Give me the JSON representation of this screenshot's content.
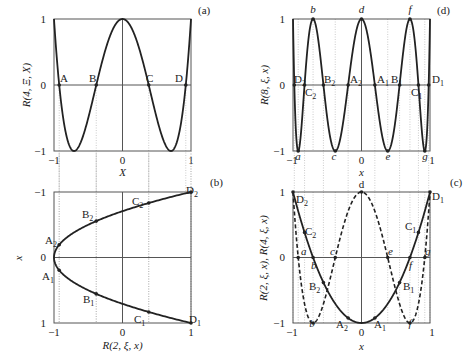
{
  "chart_data": [
    {
      "panel": "(a)",
      "type": "line",
      "title": "",
      "xlabel": "X",
      "ylabel": "R(4, Ξ, X)",
      "xlim": [
        -1,
        1
      ],
      "ylim": [
        -1,
        1
      ],
      "xticks": [
        "-1",
        "0",
        "1"
      ],
      "yticks": [
        "-1",
        "0",
        "1"
      ],
      "series": [
        {
          "name": "R(4, Ξ, X)",
          "style": "solid",
          "function": "8X^4 - 8X^2 + 1",
          "x": [
            -1,
            -0.924,
            -0.707,
            -0.383,
            0,
            0.383,
            0.707,
            0.924,
            1
          ],
          "y": [
            1,
            0,
            -1,
            0,
            1,
            0,
            -1,
            0,
            1
          ]
        }
      ],
      "points": [
        {
          "label": "A",
          "x": -0.924,
          "y": 0
        },
        {
          "label": "B",
          "x": -0.383,
          "y": 0
        },
        {
          "label": "C",
          "x": 0.383,
          "y": 0
        },
        {
          "label": "D",
          "x": 0.924,
          "y": 0
        }
      ]
    },
    {
      "panel": "(b)",
      "type": "line",
      "xlabel": "R(2, ξ, x)",
      "ylabel": "x",
      "xlim": [
        -1,
        1
      ],
      "ylim": [
        1,
        -1
      ],
      "xticks": [
        "-1",
        "0",
        "1"
      ],
      "yticks": [
        "-1",
        "0",
        "1"
      ],
      "series": [
        {
          "name": "R(2, ξ, x) = 2x^2 - 1",
          "style": "solid",
          "x": [
            1,
            0.383,
            -0.383,
            -0.924,
            -1,
            -0.924,
            -0.383,
            0.383,
            1
          ],
          "y": [
            -1,
            -0.831,
            -0.556,
            -0.195,
            0,
            0.195,
            0.556,
            0.831,
            1
          ]
        }
      ],
      "points": [
        {
          "label": "A2",
          "x": -0.924,
          "y": -0.195
        },
        {
          "label": "B2",
          "x": -0.383,
          "y": -0.556
        },
        {
          "label": "C2",
          "x": 0.383,
          "y": -0.831
        },
        {
          "label": "D2",
          "x": 1,
          "y": -1
        },
        {
          "label": "A1",
          "x": -0.924,
          "y": 0.195
        },
        {
          "label": "B1",
          "x": -0.383,
          "y": 0.556
        },
        {
          "label": "C1",
          "x": 0.383,
          "y": 0.831
        },
        {
          "label": "D1",
          "x": 1,
          "y": 1
        }
      ]
    },
    {
      "panel": "(d)",
      "type": "line",
      "xlabel": "x",
      "ylabel": "R(8, ξ, x)",
      "xlim": [
        -1,
        1
      ],
      "ylim": [
        -1,
        1
      ],
      "xticks": [
        "-1",
        "0",
        "1"
      ],
      "yticks": [
        "-1",
        "0",
        "1"
      ],
      "series": [
        {
          "name": "R(8, ξ, x)",
          "style": "solid",
          "function": "T8(x)"
        }
      ],
      "points": [
        {
          "label": "D2",
          "x": -0.981,
          "y": 0
        },
        {
          "label": "C2",
          "x": -0.831,
          "y": 0
        },
        {
          "label": "B2",
          "x": -0.556,
          "y": 0
        },
        {
          "label": "A2",
          "x": -0.195,
          "y": 0
        },
        {
          "label": "A1",
          "x": 0.195,
          "y": 0
        },
        {
          "label": "B1",
          "x": 0.556,
          "y": 0
        },
        {
          "label": "C1",
          "x": 0.831,
          "y": 0
        },
        {
          "label": "D1",
          "x": 0.981,
          "y": 0
        },
        {
          "label": "a",
          "x": -0.924,
          "y": -1
        },
        {
          "label": "b",
          "x": -0.707,
          "y": 1
        },
        {
          "label": "c",
          "x": -0.383,
          "y": -1
        },
        {
          "label": "d",
          "x": 0,
          "y": 1
        },
        {
          "label": "e",
          "x": 0.383,
          "y": -1
        },
        {
          "label": "f",
          "x": 0.707,
          "y": 1
        },
        {
          "label": "g",
          "x": 0.924,
          "y": -1
        }
      ]
    },
    {
      "panel": "(c)",
      "type": "line",
      "xlabel": "x",
      "ylabel": "R(2, ξ, x), R(4, ξ, x)",
      "xlim": [
        -1,
        1
      ],
      "ylim": [
        -1,
        1
      ],
      "xticks": [
        "-1",
        "0",
        "1"
      ],
      "yticks": [
        "-1",
        "0",
        "1"
      ],
      "series": [
        {
          "name": "R(2, ξ, x)",
          "style": "solid",
          "function": "2x^2 - 1"
        },
        {
          "name": "R(4, ξ, x)",
          "style": "dashed",
          "function": "8x^4 - 8x^2 + 1"
        }
      ],
      "points": [
        {
          "label": "D2",
          "x": -1,
          "y": 1
        },
        {
          "label": "C2",
          "x": -0.831,
          "y": 0.383
        },
        {
          "label": "B2",
          "x": -0.556,
          "y": -0.383
        },
        {
          "label": "A2",
          "x": -0.195,
          "y": -0.924
        },
        {
          "label": "A1",
          "x": 0.195,
          "y": -0.924
        },
        {
          "label": "B1",
          "x": 0.556,
          "y": -0.383
        },
        {
          "label": "C1",
          "x": 0.831,
          "y": 0.383
        },
        {
          "label": "D1",
          "x": 1,
          "y": 1
        },
        {
          "label": "a",
          "x": -0.924,
          "y": 0
        },
        {
          "label": "b",
          "x": -0.707,
          "y": 0
        },
        {
          "label": "c",
          "x": -0.383,
          "y": 0
        },
        {
          "label": "d",
          "x": 0,
          "y": 1
        },
        {
          "label": "e",
          "x": 0.383,
          "y": 0
        },
        {
          "label": "f",
          "x": 0.707,
          "y": 0
        },
        {
          "label": "g",
          "x": 0.924,
          "y": 0
        }
      ]
    }
  ],
  "panels": {
    "a": {
      "tag": "(a)",
      "ylabel": "R(4, Ξ, X)",
      "xlabel": "X",
      "yt_top": "1",
      "yt_mid": "0",
      "yt_bot": "−1",
      "xt_left": "−1",
      "xt_mid": "0",
      "xt_right": "1",
      "pts": [
        "A",
        "B",
        "C",
        "D"
      ]
    },
    "b": {
      "tag": "(b)",
      "ylabel": "x",
      "xlabel": "R(2, ξ, x)",
      "yt_top": "−1",
      "yt_mid": "0",
      "yt_bot": "1",
      "xt_left": "−1",
      "xt_mid": "0",
      "xt_right": "1"
    },
    "d": {
      "tag": "(d)",
      "ylabel": "R(8, ξ, x)",
      "xlabel": "x",
      "yt_top": "1",
      "yt_mid": "0",
      "yt_bot": "−1",
      "xt_left": "−1",
      "xt_mid": "0",
      "xt_right": "1"
    },
    "c": {
      "tag": "(c)",
      "ylabel": "R(2, ξ, x), R(4, ξ, x)",
      "xlabel": "x",
      "yt_top": "1",
      "yt_mid": "0",
      "yt_bot": "−1",
      "xt_left": "−1",
      "xt_mid": "0",
      "xt_right": "1"
    }
  },
  "labels": {
    "A": "A",
    "B": "B",
    "C": "C",
    "D": "D",
    "A1": "A",
    "A2": "A",
    "B1": "B",
    "B2": "B",
    "C1": "C",
    "C2": "C",
    "D1": "D",
    "D2": "D",
    "s1": "1",
    "s2": "2",
    "a": "a",
    "b": "b",
    "c": "c",
    "d": "d",
    "e": "e",
    "f": "f",
    "g": "g"
  }
}
